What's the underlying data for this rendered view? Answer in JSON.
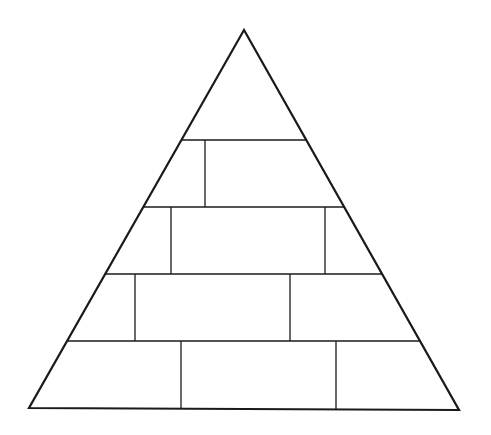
{
  "diagram": {
    "type": "pyramid",
    "levels": 5,
    "stroke_color": "#1a1a1a",
    "background": "#ffffff",
    "outline": {
      "apex": [
        244,
        30
      ],
      "bottom_left": [
        29,
        408
      ],
      "bottom_right": [
        459,
        410
      ]
    },
    "rows": [
      {
        "level": 1,
        "y_top": 30,
        "y_bottom": 140,
        "cells": 1,
        "dividers_x": []
      },
      {
        "level": 2,
        "y_top": 140,
        "y_bottom": 207,
        "cells": 2,
        "dividers_x": [
          205
        ]
      },
      {
        "level": 3,
        "y_top": 207,
        "y_bottom": 274,
        "cells": 3,
        "dividers_x": [
          171,
          325
        ]
      },
      {
        "level": 4,
        "y_top": 274,
        "y_bottom": 341,
        "cells": 3,
        "dividers_x": [
          135,
          290
        ]
      },
      {
        "level": 5,
        "y_top": 341,
        "y_bottom": 409,
        "cells": 3,
        "dividers_x": [
          181,
          336
        ]
      }
    ],
    "labels": []
  }
}
